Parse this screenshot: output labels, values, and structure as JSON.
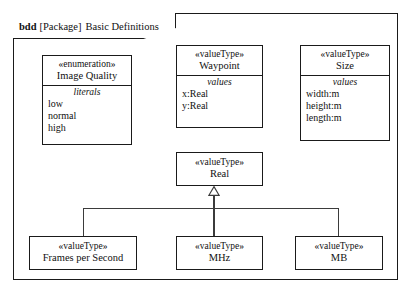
{
  "diagram": {
    "frame": {
      "kind": "bdd",
      "scope": "[Package]",
      "name": "Basic Definitions",
      "header_full": "bdd [Package] Basic Definitions"
    },
    "blocks": [
      {
        "id": "image-quality",
        "stereotype": "«enumeration»",
        "name": "Image Quality",
        "compartment_title": "literals",
        "items": [
          "low",
          "normal",
          "high"
        ]
      },
      {
        "id": "waypoint",
        "stereotype": "«valueType»",
        "name": "Waypoint",
        "compartment_title": "values",
        "items": [
          "x:Real",
          "y:Real"
        ]
      },
      {
        "id": "size",
        "stereotype": "«valueType»",
        "name": "Size",
        "compartment_title": "values",
        "items": [
          "width:m",
          "height:m",
          "length:m"
        ]
      },
      {
        "id": "real",
        "stereotype": "«valueType»",
        "name": "Real",
        "compartment_title": "",
        "items": []
      },
      {
        "id": "frames-per-second",
        "stereotype": "«valueType»",
        "name": "Frames per Second",
        "compartment_title": "",
        "items": []
      },
      {
        "id": "mhz",
        "stereotype": "«valueType»",
        "name": "MHz",
        "compartment_title": "",
        "items": []
      },
      {
        "id": "mb",
        "stereotype": "«valueType»",
        "name": "MB",
        "compartment_title": "",
        "items": []
      }
    ],
    "relationships": [
      {
        "type": "generalization",
        "source": "frames-per-second",
        "target": "real"
      },
      {
        "type": "generalization",
        "source": "mhz",
        "target": "real"
      },
      {
        "type": "generalization",
        "source": "mb",
        "target": "real"
      }
    ],
    "colors": {
      "stroke": "#1a1a1a",
      "connector": "#3b3b3b",
      "background": "#ffffff",
      "text": "#111111"
    }
  }
}
